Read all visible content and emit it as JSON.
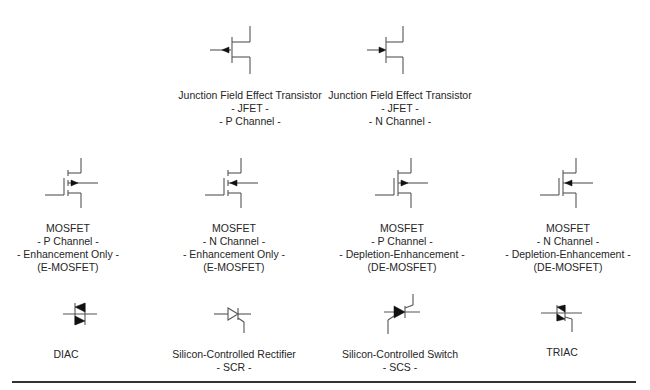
{
  "diagram": {
    "rows": [
      {
        "name": "jfet-row",
        "items": [
          {
            "symbol": "jfet-p-channel-symbol",
            "lines": [
              "Junction Field Effect Transistor",
              "- JFET -",
              "- P Channel -"
            ]
          },
          {
            "symbol": "jfet-n-channel-symbol",
            "lines": [
              "Junction Field Effect Transistor",
              "- JFET -",
              "- N Channel -"
            ]
          }
        ]
      },
      {
        "name": "mosfet-row",
        "items": [
          {
            "symbol": "e-mosfet-p-channel-symbol",
            "lines": [
              "MOSFET",
              "- P Channel -",
              "- Enhancement Only -",
              "(E-MOSFET)"
            ]
          },
          {
            "symbol": "e-mosfet-n-channel-symbol",
            "lines": [
              "MOSFET",
              "- N Channel -",
              "- Enhancement Only -",
              "(E-MOSFET)"
            ]
          },
          {
            "symbol": "de-mosfet-p-channel-symbol",
            "lines": [
              "MOSFET",
              "- P Channel -",
              "- Depletion-Enhancement -",
              "(DE-MOSFET)"
            ]
          },
          {
            "symbol": "de-mosfet-n-channel-symbol",
            "lines": [
              "MOSFET",
              "- N Channel -",
              "- Depletion-Enhancement -",
              "(DE-MOSFET)"
            ]
          }
        ]
      },
      {
        "name": "thyristor-row",
        "items": [
          {
            "symbol": "diac-symbol",
            "lines": [
              "DIAC"
            ]
          },
          {
            "symbol": "scr-symbol",
            "lines": [
              "Silicon-Controlled Rectifier",
              "- SCR -"
            ]
          },
          {
            "symbol": "scs-symbol",
            "lines": [
              "Silicon-Controlled Switch",
              "- SCS -"
            ]
          },
          {
            "symbol": "triac-symbol",
            "lines": [
              "TRIAC"
            ]
          }
        ]
      }
    ],
    "colors": {
      "line": "#555555",
      "fill": "#111111",
      "text": "#262626",
      "rule": "#333333"
    }
  }
}
